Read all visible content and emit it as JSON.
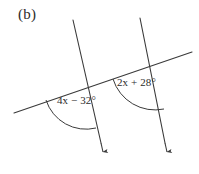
{
  "figure": {
    "label": "(b)",
    "background_color": "#ffffff",
    "stroke_color": "#3a3a3a",
    "text_color": "#2b2b2b"
  },
  "angles": [
    {
      "id": "left",
      "label": "4x − 32°",
      "expression": "4x - 32",
      "unit": "degrees"
    },
    {
      "id": "right",
      "label": "2x + 28°",
      "expression": "2x + 28",
      "unit": "degrees"
    }
  ],
  "geometry": {
    "transversal": {
      "name": "transversal-line",
      "x1": 14,
      "y1": 113,
      "x2": 192,
      "y2": 52
    },
    "parallel_lines": [
      {
        "name": "left-parallel-line",
        "x1": 73,
        "y1": 20,
        "x2": 103,
        "y2": 152,
        "arrow_end": "bottom"
      },
      {
        "name": "right-parallel-line",
        "x1": 140,
        "y1": 18,
        "x2": 167,
        "y2": 152,
        "arrow_end": "bottom"
      }
    ],
    "intersections": [
      {
        "name": "left-intersection",
        "x": 88,
        "y": 87
      },
      {
        "name": "right-intersection",
        "x": 155,
        "y": 66
      }
    ],
    "arcs": [
      {
        "name": "left-angle-arc",
        "center_x": 88,
        "center_y": 87,
        "radius": 42,
        "path": "M 46 100 A 42 42 0 0 0 96 128"
      },
      {
        "name": "right-angle-arc",
        "center_x": 155,
        "center_y": 66,
        "radius": 44,
        "path": "M 113 79 A 44 44 0 0 0 164 109"
      }
    ]
  }
}
